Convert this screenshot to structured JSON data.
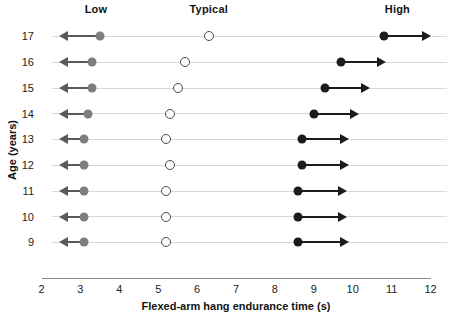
{
  "chart_data": {
    "type": "scatter",
    "title": "",
    "xlabel": "Flexed-arm hang endurance time (s)",
    "ylabel": "Age (years)",
    "xlim": [
      2,
      12
    ],
    "ylim": [
      9,
      17
    ],
    "grid": true,
    "x_ticks": [
      "2",
      "3",
      "4",
      "5",
      "6",
      "7",
      "8",
      "9",
      "10",
      "11",
      "12"
    ],
    "y_ticks": [
      "17",
      "16",
      "15",
      "14",
      "13",
      "12",
      "11",
      "10",
      "9"
    ],
    "band_labels": [
      {
        "label": "Low",
        "x": 3.4
      },
      {
        "label": "Typical",
        "x": 6.3
      },
      {
        "label": "High",
        "x": 11.15
      }
    ],
    "legend_position": "top",
    "series": [
      {
        "name": "Low",
        "marker": "filled-circle-gray",
        "color": "#7e7e7e",
        "direction": "left"
      },
      {
        "name": "Typical",
        "marker": "open-circle",
        "color": "#4a4a4a",
        "direction": "none"
      },
      {
        "name": "High",
        "marker": "filled-circle-black",
        "color": "#1c1c1c",
        "direction": "right"
      }
    ],
    "rows": [
      {
        "age": "17",
        "low": 3.5,
        "low_arrow_to": 2.45,
        "typical": 6.3,
        "high": 10.8,
        "high_arrow_to": 12.0
      },
      {
        "age": "16",
        "low": 3.3,
        "low_arrow_to": 2.45,
        "typical": 5.7,
        "high": 9.7,
        "high_arrow_to": 10.85
      },
      {
        "age": "15",
        "low": 3.3,
        "low_arrow_to": 2.45,
        "typical": 5.5,
        "high": 9.3,
        "high_arrow_to": 10.45
      },
      {
        "age": "14",
        "low": 3.2,
        "low_arrow_to": 2.45,
        "typical": 5.3,
        "high": 9.0,
        "high_arrow_to": 10.15
      },
      {
        "age": "13",
        "low": 3.1,
        "low_arrow_to": 2.45,
        "typical": 5.2,
        "high": 8.7,
        "high_arrow_to": 9.9
      },
      {
        "age": "12",
        "low": 3.1,
        "low_arrow_to": 2.45,
        "typical": 5.3,
        "high": 8.7,
        "high_arrow_to": 9.9
      },
      {
        "age": "11",
        "low": 3.1,
        "low_arrow_to": 2.45,
        "typical": 5.2,
        "high": 8.6,
        "high_arrow_to": 9.85
      },
      {
        "age": "10",
        "low": 3.1,
        "low_arrow_to": 2.45,
        "typical": 5.2,
        "high": 8.6,
        "high_arrow_to": 9.85
      },
      {
        "age": "9",
        "low": 3.1,
        "low_arrow_to": 2.45,
        "typical": 5.2,
        "high": 8.6,
        "high_arrow_to": 9.9
      }
    ]
  }
}
